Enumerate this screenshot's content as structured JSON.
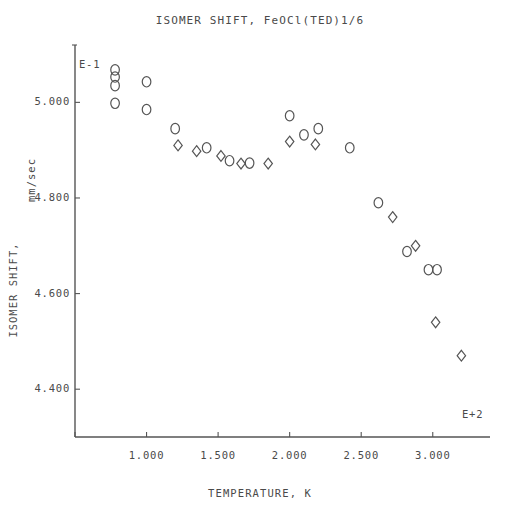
{
  "chart_data": {
    "type": "scatter",
    "title": "ISOMER SHIFT, FeOCl(TED)1/6",
    "xlabel": "TEMPERATURE, K",
    "ylabel": "ISOMER SHIFT,",
    "ylabel_units": "mm/sec",
    "x_exponent_label": "E+2",
    "y_exponent_label": "E-1",
    "xlim": [
      0.5,
      3.4
    ],
    "ylim": [
      4.3,
      5.12
    ],
    "xticks": [
      "1.000",
      "1.500",
      "2.000",
      "2.500",
      "3.000"
    ],
    "xtick_values": [
      1.0,
      1.5,
      2.0,
      2.5,
      3.0
    ],
    "yticks": [
      "5.000",
      "4.800",
      "4.600",
      "4.400"
    ],
    "ytick_values": [
      5.0,
      4.8,
      4.6,
      4.4
    ],
    "grid": false,
    "legend": "none",
    "x_units_note": "x values in units of E+2 K",
    "y_units_note": "y values in units of E-1 mm/sec",
    "series": [
      {
        "name": "circle-series",
        "marker": "circle",
        "points": [
          [
            0.78,
            5.068
          ],
          [
            0.78,
            5.053
          ],
          [
            0.78,
            5.035
          ],
          [
            0.78,
            4.998
          ],
          [
            1.0,
            5.043
          ],
          [
            1.0,
            4.985
          ],
          [
            1.2,
            4.945
          ],
          [
            1.42,
            4.905
          ],
          [
            1.58,
            4.878
          ],
          [
            1.72,
            4.873
          ],
          [
            2.0,
            4.972
          ],
          [
            2.1,
            4.932
          ],
          [
            2.2,
            4.945
          ],
          [
            2.42,
            4.905
          ],
          [
            2.62,
            4.79
          ],
          [
            2.82,
            4.688
          ],
          [
            2.97,
            4.65
          ],
          [
            3.03,
            4.65
          ]
        ]
      },
      {
        "name": "diamond-series",
        "marker": "diamond",
        "points": [
          [
            1.22,
            4.91
          ],
          [
            1.35,
            4.898
          ],
          [
            1.52,
            4.888
          ],
          [
            1.66,
            4.872
          ],
          [
            1.85,
            4.872
          ],
          [
            2.0,
            4.918
          ],
          [
            2.18,
            4.912
          ],
          [
            2.72,
            4.76
          ],
          [
            2.88,
            4.7
          ],
          [
            3.02,
            4.54
          ],
          [
            3.2,
            4.47
          ]
        ]
      }
    ]
  },
  "geometry": {
    "plot_left": 75,
    "plot_right": 490,
    "plot_top": 45,
    "plot_bottom": 437
  }
}
